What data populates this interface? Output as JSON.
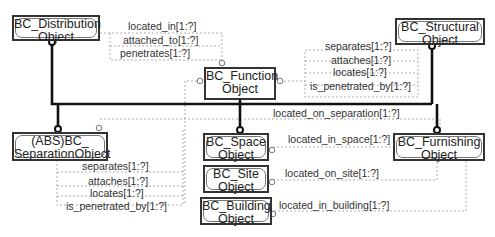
{
  "entities": {
    "distribution": {
      "line1": "BC_Distribution",
      "line2": "Object"
    },
    "function": {
      "line1": "BC_Function",
      "line2": "Object"
    },
    "structural": {
      "line1": "BC_Structural",
      "line2": "Object"
    },
    "separation": {
      "line1": "(ABS)BC_",
      "line2": "SeparationObject"
    },
    "space": {
      "line1": "BC_Space",
      "line2": "Object"
    },
    "furnishing": {
      "line1": "BC_Furnishing",
      "line2": "Object"
    },
    "site": {
      "line1": "BC_Site",
      "line2": "Object"
    },
    "building": {
      "line1": "BC_Building",
      "line2": "Object"
    }
  },
  "function_attributes": [
    "located_in[1:?]",
    "attached_to[1:?]",
    "penetrates[1:?]"
  ],
  "structural_attributes": [
    "separates[1:?]",
    "attaches[1:?]",
    "locates[1:?]",
    "is_penetrated_by[1:?]"
  ],
  "separation_attributes": [
    "separates[1:?]",
    "attaches[1:?]",
    "locates[1:?]",
    "is_penetrated_by[1:?]"
  ],
  "relations": {
    "located_on_separation": "located_on_separation[1:?]",
    "located_in_space": "located_in_space[1:?]",
    "located_on_site": "located_on_site[1:?]",
    "located_in_building": "located_in_building[1:?]"
  }
}
